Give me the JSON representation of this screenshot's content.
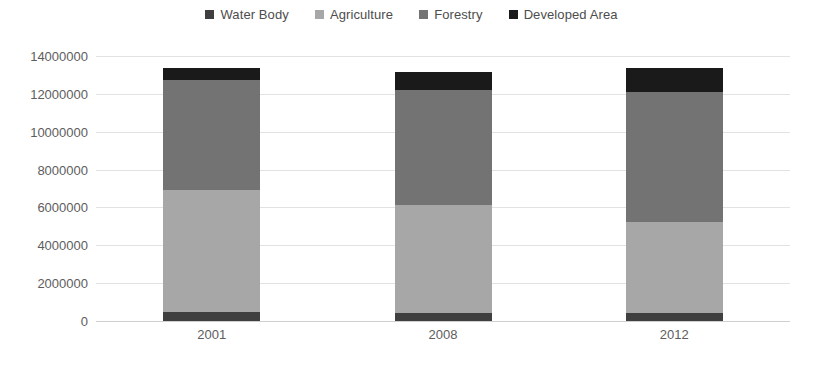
{
  "chart_data": {
    "type": "bar",
    "stacked": true,
    "title": "",
    "xlabel": "",
    "ylabel": "",
    "categories": [
      "2001",
      "2008",
      "2012"
    ],
    "ylim": [
      0,
      14000000
    ],
    "ytick_step": 2000000,
    "ytick_labels": [
      "14000000",
      "12000000",
      "10000000",
      "8000000",
      "6000000",
      "4000000",
      "2000000",
      "0"
    ],
    "ytick_values": [
      14000000,
      12000000,
      10000000,
      8000000,
      6000000,
      4000000,
      2000000,
      0
    ],
    "grid": true,
    "legend_position": "top-center",
    "stack_order_bottom_to_top": [
      "Water Body",
      "Agriculture",
      "Forestry",
      "Developed Area"
    ],
    "series": [
      {
        "name": "Water Body",
        "color": "#3f3f3f",
        "values": [
          450000,
          420000,
          420000
        ]
      },
      {
        "name": "Agriculture",
        "color": "#a7a7a7",
        "values": [
          6450000,
          5700000,
          4800000
        ]
      },
      {
        "name": "Forestry",
        "color": "#737373",
        "values": [
          5820000,
          6080000,
          6860000
        ]
      },
      {
        "name": "Developed Area",
        "color": "#1a1a1a",
        "values": [
          630000,
          950000,
          1270000
        ]
      }
    ],
    "totals": [
      13350000,
      13150000,
      13350000
    ]
  },
  "legend": {
    "items": [
      {
        "label": "Water Body",
        "color": "#3f3f3f"
      },
      {
        "label": "Agriculture",
        "color": "#a7a7a7"
      },
      {
        "label": "Forestry",
        "color": "#737373"
      },
      {
        "label": "Developed Area",
        "color": "#1a1a1a"
      }
    ]
  },
  "colors": {
    "background": "#ffffff",
    "gridline": "#e2e2e2",
    "axis_text": "#5d5d5d",
    "legend_text": "#4d4d4d"
  }
}
